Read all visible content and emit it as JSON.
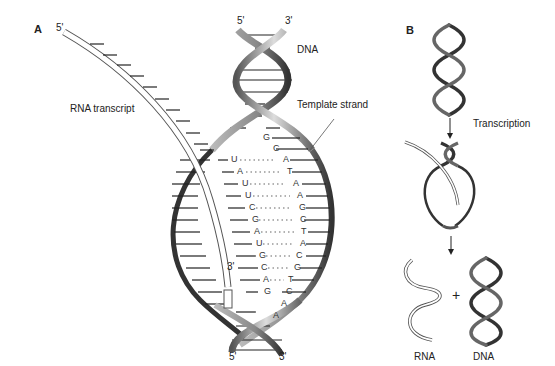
{
  "panel_a": {
    "label": "A",
    "rna_label": "RNA transcript",
    "rna_5prime": "5'",
    "rna_3prime": "3'",
    "dna_label": "DNA",
    "template_label": "Template strand",
    "top_5prime": "5'",
    "top_3prime": "3'",
    "bottom_5prime": "5'",
    "bottom_3prime": "3'",
    "template_unpaired_top": [
      "G",
      "C"
    ],
    "pairs": [
      {
        "rna": "U",
        "dna": "A"
      },
      {
        "rna": "A",
        "dna": "T"
      },
      {
        "rna": "U",
        "dna": "A"
      },
      {
        "rna": "U",
        "dna": "A"
      },
      {
        "rna": "C",
        "dna": "G"
      },
      {
        "rna": "G",
        "dna": "C"
      },
      {
        "rna": "A",
        "dna": "T"
      },
      {
        "rna": "U",
        "dna": "A"
      },
      {
        "rna": "G",
        "dna": "C"
      },
      {
        "rna": "C",
        "dna": "G"
      },
      {
        "rna": "A",
        "dna": "T"
      }
    ],
    "template_bottom": [
      {
        "left": "G",
        "right": "C"
      },
      {
        "left": "",
        "right": "A"
      },
      {
        "left": "",
        "right": "A"
      }
    ]
  },
  "panel_b": {
    "label": "B",
    "step_label": "Transcription",
    "plus": "+",
    "rna_label": "RNA",
    "dna_label": "DNA"
  }
}
